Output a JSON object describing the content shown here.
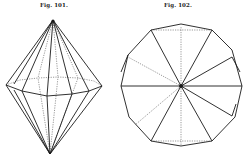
{
  "figures": [
    {
      "id": "fig-101",
      "label": "Fig. 101.",
      "depicts": "double pyramid (bipyramid), side view"
    },
    {
      "id": "fig-102",
      "label": "Fig. 102.",
      "depicts": "polygonal crystal face, top view with radial edges"
    }
  ],
  "colors": {
    "ink": "#1a1a1a",
    "paper": "#ffffff"
  }
}
